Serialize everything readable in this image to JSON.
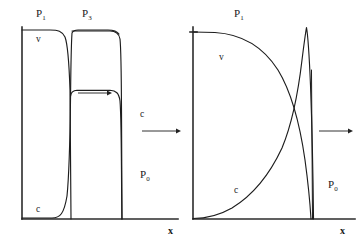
{
  "figure": {
    "type": "scientific-diagram",
    "width": 363,
    "height": 242,
    "background_color": "#ffffff",
    "line_color": "#1d1d1d"
  },
  "panels": [
    {
      "id": "left-panel",
      "name": "initial-profile-panel",
      "axis": {
        "x_label": "x",
        "y_label": "",
        "origin_x": 22,
        "origin_y": 219,
        "x_end": 178,
        "y_top": 27
      },
      "region_labels": [
        {
          "id": "p1",
          "base": "P",
          "sub": "1",
          "x": 40,
          "y": 17
        },
        {
          "id": "p3",
          "base": "P",
          "sub": "3",
          "x": 85,
          "y": 17
        },
        {
          "id": "p0",
          "base": "P",
          "sub": "0",
          "x": 143,
          "y": 178
        }
      ],
      "curve_labels": [
        {
          "id": "v-label",
          "text": "v",
          "x": 38,
          "y": 39
        },
        {
          "id": "c-label-low",
          "text": "c",
          "x": 38,
          "y": 210
        }
      ],
      "inner_arrow": {
        "id": "shock-propagation-arrow",
        "x1": 78,
        "y1": 93,
        "x2": 110,
        "y2": 93,
        "direction": "right"
      },
      "curves": [
        {
          "id": "v-curve-left",
          "name": "velocity-profile",
          "description": "High plateau at P1 level dropping steeply to zero at the interface"
        },
        {
          "id": "c-curve-left",
          "name": "concentration-profile",
          "description": "Near zero through P1, rising steeply with overshoot to an intermediate plateau across P3, then dropping to zero at the contact"
        }
      ]
    },
    {
      "id": "right-panel",
      "name": "evolved-profile-panel",
      "axis": {
        "x_label": "x",
        "y_label": "",
        "origin_x": 193,
        "origin_y": 219,
        "x_end": 355,
        "y_top": 27
      },
      "region_labels": [
        {
          "id": "p1",
          "base": "P",
          "sub": "1",
          "x": 238,
          "y": 17
        },
        {
          "id": "p0",
          "base": "P",
          "sub": "0",
          "x": 331,
          "y": 188
        }
      ],
      "curve_labels": [
        {
          "id": "v-label",
          "text": "v",
          "x": 222,
          "y": 57
        },
        {
          "id": "c-label",
          "text": "c",
          "x": 237,
          "y": 190
        }
      ],
      "curves": [
        {
          "id": "v-curve-right",
          "name": "velocity-profile-decayed",
          "description": "Starts at P1 plateau level and decays smoothly and increasingly steeply to zero at the shock front"
        },
        {
          "id": "c-curve-right",
          "name": "concentration-spike",
          "description": "Rises exponentially from zero, crosses the v curve, forms a tall narrow spike at the shock front, then drops vertically to zero"
        }
      ]
    }
  ],
  "transition_arrow": {
    "id": "evolution-arrow",
    "name": "time-evolution-arrow",
    "x1": 140,
    "y1": 130,
    "x2": 180,
    "y2": 130,
    "direction": "right"
  },
  "trailing_arrow": {
    "id": "trailing-propagation-arrow",
    "name": "shock-motion-arrow",
    "x1": 317,
    "y1": 131,
    "x2": 352,
    "y2": 131,
    "direction": "right"
  }
}
